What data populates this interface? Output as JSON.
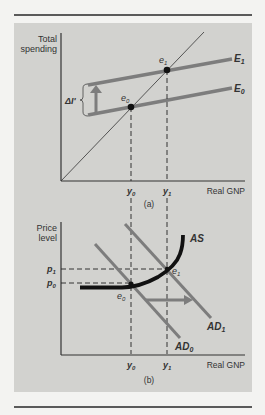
{
  "figure": {
    "panel_a": {
      "caption": "(a)",
      "y_axis_label_line1": "Total",
      "y_axis_label_line2": "spending",
      "x_axis_label": "Real GNP",
      "curves": [
        {
          "name": "E",
          "sub": "1",
          "label": "E1"
        },
        {
          "name": "E",
          "sub": "0",
          "label": "E0"
        }
      ],
      "points": [
        {
          "name": "e",
          "sub": "0",
          "label": "e0"
        },
        {
          "name": "e",
          "sub": "1",
          "label": "e1"
        }
      ],
      "x_ticks": [
        {
          "name": "y",
          "sub": "0"
        },
        {
          "name": "y",
          "sub": "1"
        }
      ],
      "shift_label": "ΔI'"
    },
    "panel_b": {
      "caption": "(b)",
      "y_axis_label_line1": "Price",
      "y_axis_label_line2": "level",
      "x_axis_label": "Real GNP",
      "curves": [
        {
          "name": "AS",
          "sub": "",
          "label": "AS"
        },
        {
          "name": "AD",
          "sub": "1",
          "label": "AD1"
        },
        {
          "name": "AD",
          "sub": "0",
          "label": "AD0"
        }
      ],
      "points": [
        {
          "name": "e",
          "sub": "0",
          "label": "e0"
        },
        {
          "name": "e",
          "sub": "1",
          "label": "e1"
        }
      ],
      "y_ticks": [
        {
          "name": "p",
          "sub": "1"
        },
        {
          "name": "p",
          "sub": "0"
        }
      ],
      "x_ticks": [
        {
          "name": "y",
          "sub": "0"
        },
        {
          "name": "y",
          "sub": "1"
        }
      ]
    },
    "colors": {
      "background": "#d2d2cf",
      "shift_lines": "#7d7d7d",
      "curve_dark": "#111111",
      "axis": "#333333"
    }
  }
}
